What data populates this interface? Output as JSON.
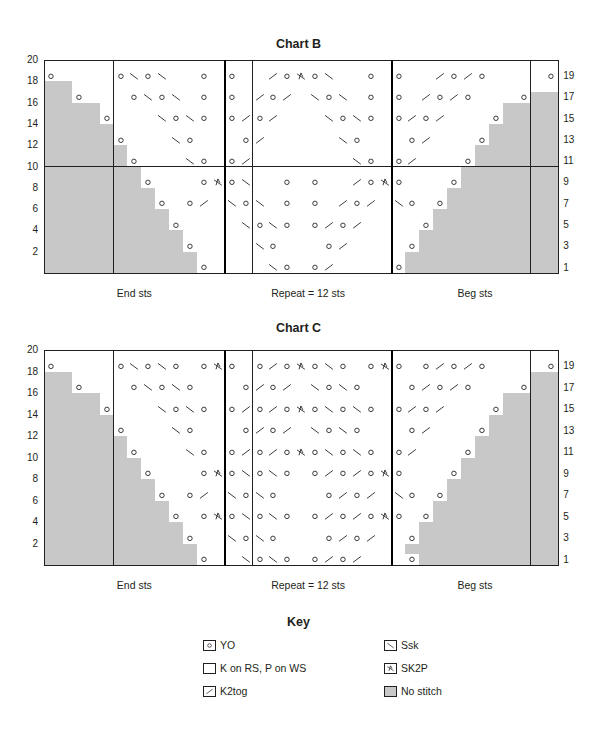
{
  "symbols": {
    "O": {
      "name": "yo",
      "label": "YO"
    },
    ".": {
      "name": "knit",
      "label": "K on RS, P on WS"
    },
    "/": {
      "name": "k2tog",
      "label": "K2tog"
    },
    "\\": {
      "name": "ssk",
      "label": "Ssk"
    },
    "A": {
      "name": "sk2p",
      "label": "SK2P"
    },
    "#": {
      "name": "no-stitch",
      "label": "No stitch"
    }
  },
  "colors": {
    "grid": "#231f20",
    "no_stitch": "#c8c8c8",
    "background": "#ffffff"
  },
  "charts": [
    {
      "title": "Chart B",
      "columns": 37,
      "section_widths": [
        13,
        12,
        12
      ],
      "section_labels": [
        "End sts",
        "Repeat = 12 sts",
        "Beg sts"
      ],
      "left_row_numbers": [
        "20",
        "18",
        "16",
        "14",
        "12",
        "10",
        "8",
        "6",
        "4",
        "2"
      ],
      "right_row_numbers": [
        "19",
        "17",
        "15",
        "13",
        "11",
        "9",
        "7",
        "5",
        "3",
        "1"
      ],
      "rows_top_to_bottom": [
        ".....................................",
        "O....O\\O\\..O.O../OAO\\..O.O../O/O....O",
        "##.......................................##",
        "##O...O\\O\\.O.O./O/.\\O\\.O.O./O/O...O##",
        "####.............................####",
        "####O...\\O\\O.O/O/...\\O\\O.O/O/...O####",
        "#####...........................#####",
        "#####O...\\O...O/.....\\O...O/...O#####",
        "######.........................######",
        "######O...\\O.O/.......\\O.O/...O######",
        "#######.......................#######",
        "#######O...OAO\\..O.O../OAO...O#######",
        "########.....................########",
        "########O.O/.\\O\\.O.O./O/.\\O.O########",
        "#########...................#########",
        "#########O....\\O\\O.O/O/....O#########",
        "##########.................##########",
        "##########O....\\O...O/....O##########",
        "###########...............###########",
        "###########O....\\O.O/....O###########"
      ]
    },
    {
      "title": "Chart C",
      "columns": 37,
      "section_widths": [
        13,
        12,
        12
      ],
      "section_labels": [
        "End sts",
        "Repeat = 12 sts",
        "Beg sts"
      ],
      "left_row_numbers": [
        "20",
        "18",
        "16",
        "14",
        "12",
        "10",
        "8",
        "6",
        "4",
        "2"
      ],
      "right_row_numbers": [
        "19",
        "17",
        "15",
        "13",
        "11",
        "9",
        "7",
        "5",
        "3",
        "1"
      ],
      "rows_top_to_bottom": [
        ".....................................",
        "O....O\\O\\O.OAO.O/OAO\\O.OAO.O/O/O....O",
        "##.................................##",
        "##O...O\\O\\O...O/O/.\\O\\O...O/O/O...O##",
        "####.............................####",
        "####O...\\O\\O.O/O/OAO\\O\\O.O/O/...O####",
        "#####...........................#####",
        "#####O...\\O...O/O/.\\O\\O...O/...O#####",
        "######.........................######",
        "######O...\\O.O/O/OAO\\O\\O.O/...O######",
        "#######.......................#######",
        "#######O...OAO\\O\\O.O/O/OAO...O#######",
        "########.....................########",
        "########O.O/.\\O\\O...O/O/.\\O.O########",
        "#########...................#########",
        "#########O.OAO\\O\\O.O/O/OAO.O#########",
        "##########.................##########",
        "##########O..\\O\\O...O/O/..O##########",
        "###########...............###########",
        "###########O..\\O\\O.O/O/...O###########"
      ]
    }
  ],
  "key": {
    "title": "Key",
    "items": [
      {
        "symbol": "O",
        "label": "YO"
      },
      {
        "symbol": "\\",
        "label": "Ssk"
      },
      {
        "symbol": ".",
        "label": "K on RS, P on WS"
      },
      {
        "symbol": "A",
        "label": "SK2P"
      },
      {
        "symbol": "/",
        "label": "K2tog"
      },
      {
        "symbol": "#",
        "label": "No stitch"
      }
    ]
  }
}
